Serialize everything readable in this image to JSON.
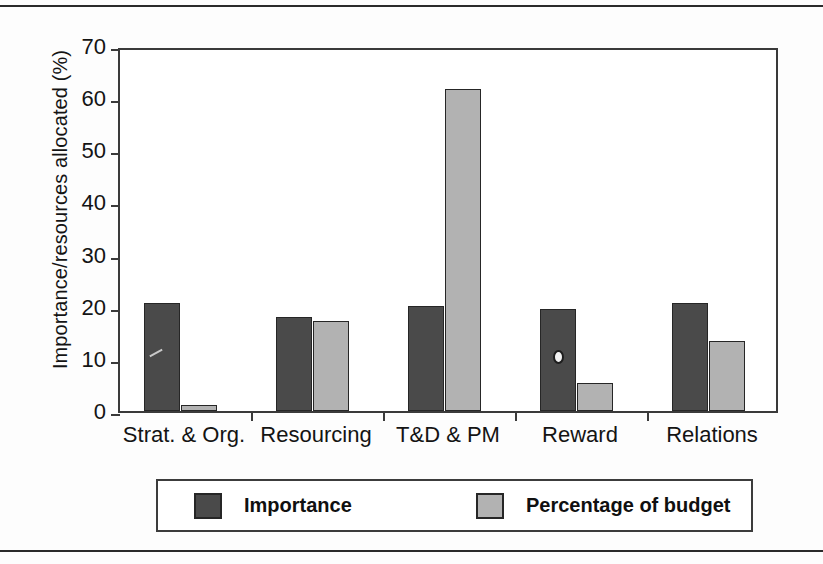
{
  "chart_data": {
    "type": "bar",
    "title": "",
    "xlabel": "",
    "ylabel": "Importance/resources allocated (%)",
    "ylim": [
      0,
      70
    ],
    "yticks": [
      0,
      10,
      20,
      30,
      40,
      50,
      60,
      70
    ],
    "ytick_labels": [
      "0",
      "10",
      "20",
      "30",
      "40",
      "50",
      "60",
      "70"
    ],
    "grid": false,
    "legend_position": "bottom",
    "categories": [
      "Strat. & Org.",
      "Resourcing",
      "T&D & PM",
      "Reward",
      "Relations"
    ],
    "series": [
      {
        "name": "Importance",
        "color": "#4a4a4a",
        "values": [
          20.8,
          18.1,
          20.1,
          19.5,
          20.8
        ]
      },
      {
        "name": "Percentage of budget",
        "color": "#b2b2b2",
        "values": [
          1.2,
          17.3,
          61.7,
          5.4,
          13.4
        ]
      }
    ]
  },
  "legend": {
    "items": [
      {
        "label": "Importance",
        "color": "#4a4a4a"
      },
      {
        "label": "Percentage of budget",
        "color": "#b2b2b2"
      }
    ]
  }
}
